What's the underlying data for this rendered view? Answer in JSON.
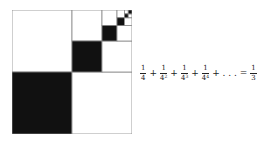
{
  "figure": {
    "colors": {
      "filled": "#111111",
      "empty": "#ffffff",
      "stroke": "#888888"
    },
    "levels": 5
  },
  "formula": {
    "terms": [
      {
        "num": "1",
        "den": "4",
        "exp": ""
      },
      {
        "num": "1",
        "den": "4",
        "exp": "2"
      },
      {
        "num": "1",
        "den": "4",
        "exp": "3"
      },
      {
        "num": "1",
        "den": "4",
        "exp": "4"
      }
    ],
    "plus": "+",
    "ellipsis": "+ . . . =",
    "result": {
      "num": "1",
      "den": "3"
    }
  }
}
